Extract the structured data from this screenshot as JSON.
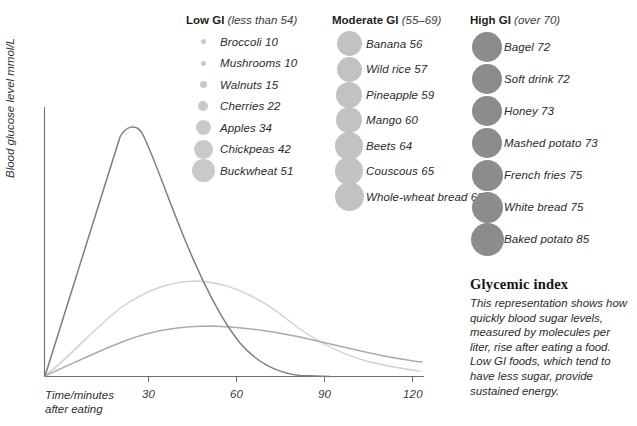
{
  "chart_data": {
    "type": "line",
    "title": "",
    "xlabel": "Time/minutes after eating",
    "ylabel": "Blood glucose level mmol/L",
    "x_ticks": [
      30,
      60,
      90,
      120
    ],
    "xlim": [
      0,
      128
    ],
    "grid": false,
    "legend": "none",
    "series": [
      {
        "name": "High GI",
        "color": "#7d7d7d",
        "peak_time": 27,
        "peak_value": 9.4,
        "points": [
          [
            0,
            0
          ],
          [
            10,
            4.4
          ],
          [
            18,
            7.4
          ],
          [
            27,
            9.4
          ],
          [
            36,
            7.8
          ],
          [
            45,
            5.9
          ],
          [
            55,
            4.0
          ],
          [
            65,
            2.6
          ],
          [
            75,
            1.6
          ],
          [
            85,
            0.9
          ],
          [
            95,
            0.45
          ],
          [
            105,
            0.2
          ],
          [
            115,
            0.08
          ],
          [
            120,
            0.04
          ]
        ]
      },
      {
        "name": "Moderate GI",
        "color": "#cfcfcf",
        "peak_time": 40,
        "peak_value": 5.1,
        "points": [
          [
            0,
            0
          ],
          [
            8,
            1.9
          ],
          [
            16,
            3.4
          ],
          [
            25,
            4.5
          ],
          [
            33,
            5.0
          ],
          [
            40,
            5.1
          ],
          [
            50,
            4.9
          ],
          [
            60,
            4.4
          ],
          [
            72,
            3.6
          ],
          [
            84,
            2.8
          ],
          [
            96,
            2.1
          ],
          [
            108,
            1.6
          ],
          [
            120,
            1.25
          ]
        ]
      },
      {
        "name": "Low GI",
        "color": "#a8a8a8",
        "peak_time": 47,
        "peak_value": 3.05,
        "points": [
          [
            0,
            0
          ],
          [
            8,
            1.0
          ],
          [
            17,
            1.9
          ],
          [
            27,
            2.5
          ],
          [
            37,
            2.9
          ],
          [
            47,
            3.05
          ],
          [
            58,
            3.0
          ],
          [
            70,
            2.8
          ],
          [
            82,
            2.55
          ],
          [
            94,
            2.25
          ],
          [
            106,
            2.0
          ],
          [
            120,
            1.75
          ]
        ]
      }
    ]
  },
  "columns": [
    {
      "id": "low",
      "title": "Low GI",
      "range": "(less than 54)",
      "bubble_color": "#c9c9c9",
      "items": [
        {
          "label": "Broccoli 10",
          "value": 10,
          "bubble_px": 5
        },
        {
          "label": "Mushrooms 10",
          "value": 10,
          "bubble_px": 5
        },
        {
          "label": "Walnuts 15",
          "value": 15,
          "bubble_px": 7
        },
        {
          "label": "Cherries 22",
          "value": 22,
          "bubble_px": 10
        },
        {
          "label": "Apples 34",
          "value": 34,
          "bubble_px": 15
        },
        {
          "label": "Chickpeas 42",
          "value": 42,
          "bubble_px": 19
        },
        {
          "label": "Buckwheat 51",
          "value": 51,
          "bubble_px": 23
        }
      ]
    },
    {
      "id": "moderate",
      "title": "Moderate GI",
      "range": "(55–69)",
      "bubble_color": "#c2c2c2",
      "items": [
        {
          "label": "Banana 56",
          "value": 56,
          "bubble_px": 25
        },
        {
          "label": "Wild rice 57",
          "value": 57,
          "bubble_px": 25
        },
        {
          "label": "Pineapple 59",
          "value": 59,
          "bubble_px": 26
        },
        {
          "label": "Mango 60",
          "value": 60,
          "bubble_px": 26
        },
        {
          "label": "Beets 64",
          "value": 64,
          "bubble_px": 28
        },
        {
          "label": "Couscous 65",
          "value": 65,
          "bubble_px": 28
        },
        {
          "label": "Whole-wheat bread 68",
          "value": 68,
          "bubble_px": 29
        }
      ]
    },
    {
      "id": "high",
      "title": "High GI",
      "range": "(over 70)",
      "bubble_color": "#8c8c8c",
      "items": [
        {
          "label": "Bagel 72",
          "value": 72,
          "bubble_px": 30
        },
        {
          "label": "Soft drink 72",
          "value": 72,
          "bubble_px": 30
        },
        {
          "label": "Honey 73",
          "value": 73,
          "bubble_px": 30
        },
        {
          "label": "Mashed potato 73",
          "value": 73,
          "bubble_px": 30
        },
        {
          "label": "French fries 75",
          "value": 75,
          "bubble_px": 31
        },
        {
          "label": "White bread 75",
          "value": 75,
          "bubble_px": 31
        },
        {
          "label": "Baked potato 85",
          "value": 85,
          "bubble_px": 33
        }
      ]
    }
  ],
  "caption": {
    "title": "Glycemic index",
    "body": "This representation shows how quickly blood sugar levels, measured by molecules per liter, rise after eating a food. Low GI foods, which tend to have less sugar, provide sustained energy."
  },
  "axis": {
    "y_title": "Blood glucose level mmol/L",
    "x_title_line1": "Time/minutes",
    "x_title_line2": "after eating",
    "tick_30": "30",
    "tick_60": "60",
    "tick_90": "90",
    "tick_120": "120"
  },
  "colors": {
    "axis": "#6f6f6f",
    "high_curve": "#7d7d7d",
    "moderate_curve": "#cfcfcf",
    "low_curve": "#a8a8a8"
  }
}
